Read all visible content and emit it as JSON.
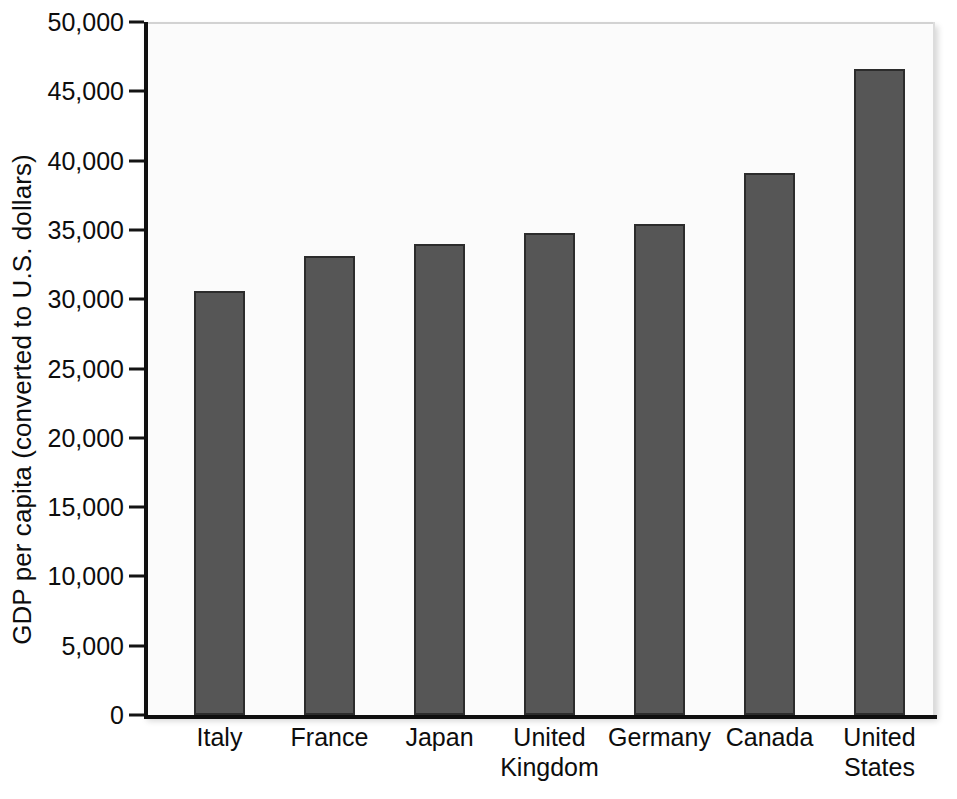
{
  "chart_data": {
    "type": "bar",
    "title": "",
    "subtitle": "",
    "xlabel": "",
    "ylabel": "GDP per capita (converted to U.S. dollars)",
    "categories": [
      "Italy",
      "France",
      "Japan",
      "United Kingdom",
      "Germany",
      "Canada",
      "United States"
    ],
    "values": [
      30600,
      33100,
      34000,
      34800,
      35400,
      39100,
      46600
    ],
    "ylim": [
      0,
      50000
    ],
    "ytick_values": [
      0,
      5000,
      10000,
      15000,
      20000,
      25000,
      30000,
      35000,
      40000,
      45000,
      50000
    ],
    "ytick_labels": [
      "0",
      "5,000",
      "10,000",
      "15,000",
      "20,000",
      "25,000",
      "30,000",
      "35,000",
      "40,000",
      "45,000",
      "50,000"
    ],
    "grid": false,
    "legend": false,
    "legend_position": "none",
    "bar_color": "#565656",
    "bar_edge_color": "#2c2c2c",
    "plot_background": "#fbfbfb",
    "axis_color": "#0f0f0f"
  }
}
